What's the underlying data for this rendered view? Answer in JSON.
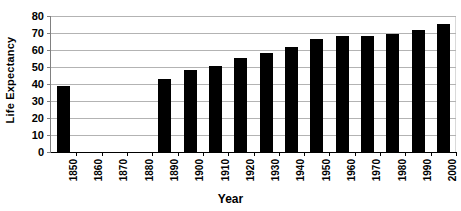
{
  "chart_data": {
    "type": "bar",
    "title": "",
    "xlabel": "Year",
    "ylabel": "Life Expectancy",
    "categories": [
      "1850",
      "1860",
      "1870",
      "1880",
      "1890",
      "1900",
      "1910",
      "1920",
      "1930",
      "1940",
      "1950",
      "1960",
      "1970",
      "1980",
      "1990",
      "2000"
    ],
    "values": [
      38.8,
      null,
      null,
      null,
      43.0,
      48.5,
      50.5,
      55.5,
      58.5,
      62.0,
      66.5,
      68.5,
      68.5,
      69.5,
      71.5,
      75.5
    ],
    "ylim": [
      0,
      80
    ],
    "ytick_labels": [
      "0",
      "10",
      "20",
      "30",
      "40",
      "50",
      "60",
      "70",
      "80"
    ],
    "ytick_values": [
      0,
      10,
      20,
      30,
      40,
      50,
      60,
      70,
      80
    ],
    "grid": true,
    "legend": "none",
    "bar_color": "#000000",
    "gridline_color": "#b3b3b3",
    "axis_color": "#000000",
    "background_color": "#ffffff"
  }
}
